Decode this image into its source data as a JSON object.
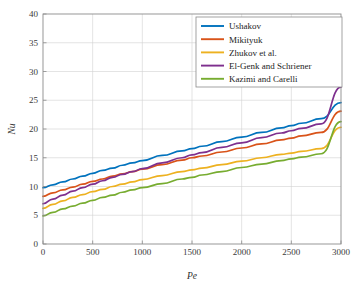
{
  "chart_data": {
    "type": "line",
    "title": "",
    "xlabel": "Pe",
    "ylabel": "Nu",
    "xlim": [
      0,
      3000
    ],
    "ylim": [
      0,
      40
    ],
    "xticks": [
      0,
      500,
      1000,
      1500,
      2000,
      2500,
      3000
    ],
    "xtick_labels": [
      "0",
      "500",
      "1000",
      "1500",
      "2000",
      "2500",
      "3000"
    ],
    "yticks": [
      0,
      5,
      10,
      15,
      20,
      25,
      30,
      35,
      40
    ],
    "ytick_labels": [
      "0",
      "5",
      "10",
      "15",
      "20",
      "25",
      "30",
      "35",
      "40"
    ],
    "grid": true,
    "legend_position": "upper-right-inside",
    "x": [
      0,
      100,
      200,
      300,
      400,
      500,
      600,
      700,
      800,
      900,
      1000,
      1200,
      1400,
      1500,
      1600,
      1800,
      2000,
      2200,
      2400,
      2500,
      2600,
      2800,
      3000
    ],
    "series": [
      {
        "name": "Ushakov",
        "color": "#0072BD",
        "values": [
          9.8,
          10.3,
          10.8,
          11.3,
          11.8,
          12.3,
          12.8,
          13.2,
          13.7,
          14.1,
          14.5,
          15.4,
          16.2,
          16.6,
          17.0,
          17.8,
          18.6,
          19.4,
          20.2,
          20.6,
          21.0,
          21.8,
          24.6
        ]
      },
      {
        "name": "Mikityuk",
        "color": "#D95319",
        "values": [
          8.3,
          8.9,
          9.4,
          9.9,
          10.4,
          10.9,
          11.3,
          11.8,
          12.2,
          12.6,
          13.0,
          13.8,
          14.6,
          15.0,
          15.3,
          16.0,
          16.7,
          17.4,
          18.1,
          18.4,
          18.8,
          19.4,
          23.1
        ]
      },
      {
        "name": "Zhukov et al.",
        "color": "#EDB120",
        "values": [
          6.2,
          6.9,
          7.5,
          8.1,
          8.6,
          9.1,
          9.5,
          10.0,
          10.4,
          10.8,
          11.2,
          11.9,
          12.6,
          12.9,
          13.2,
          13.8,
          14.4,
          15.0,
          15.6,
          15.8,
          16.1,
          16.6,
          20.3
        ]
      },
      {
        "name": "El-Genk and Schriener",
        "color": "#7E2F8E",
        "values": [
          7.0,
          7.8,
          8.5,
          9.2,
          9.8,
          10.4,
          11.0,
          11.6,
          12.1,
          12.6,
          13.1,
          14.1,
          15.0,
          15.5,
          15.9,
          16.8,
          17.6,
          18.5,
          19.3,
          19.7,
          20.1,
          20.9,
          27.3
        ]
      },
      {
        "name": "Kazimi and Carelli",
        "color": "#77AC30",
        "values": [
          4.9,
          5.5,
          6.1,
          6.6,
          7.1,
          7.6,
          8.1,
          8.5,
          9.0,
          9.4,
          9.8,
          10.5,
          11.3,
          11.6,
          12.0,
          12.6,
          13.3,
          13.9,
          14.5,
          14.8,
          15.1,
          15.7,
          21.3
        ]
      }
    ]
  },
  "legend": {
    "entries": [
      "Ushakov",
      "Mikityuk",
      "Zhukov et al.",
      "El-Genk and Schriener",
      "Kazimi and Carelli"
    ]
  }
}
